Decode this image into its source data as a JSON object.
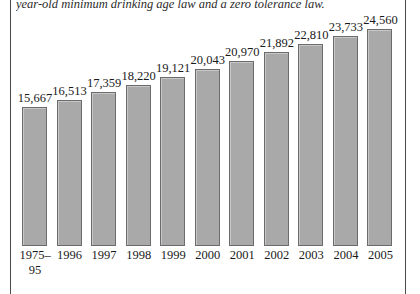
{
  "caption": {
    "text": "year-old minimum drinking age law and a zero tolerance law."
  },
  "chart_data": {
    "type": "bar",
    "title": "",
    "subtitle": "",
    "xlabel": "",
    "ylabel": "",
    "grid": false,
    "legend": null,
    "axis_line": false,
    "ylim": [
      0,
      26000
    ],
    "categories": [
      "1975–95",
      "1996",
      "1997",
      "1998",
      "1999",
      "2000",
      "2001",
      "2002",
      "2003",
      "2004",
      "2005"
    ],
    "category_lines": [
      [
        "1975–",
        "95"
      ],
      [
        "1996"
      ],
      [
        "1997"
      ],
      [
        "1998"
      ],
      [
        "1999"
      ],
      [
        "2000"
      ],
      [
        "2001"
      ],
      [
        "2002"
      ],
      [
        "2003"
      ],
      [
        "2004"
      ],
      [
        "2005"
      ]
    ],
    "values": [
      15667,
      16513,
      17359,
      18220,
      19121,
      20043,
      20970,
      21892,
      22810,
      23733,
      24560
    ],
    "value_labels": [
      "15,667",
      "16,513",
      "17,359",
      "18,220",
      "19,121",
      "20,043",
      "20,970",
      "21,892",
      "22,810",
      "23,733",
      "24,560"
    ],
    "colors": {
      "bar_fill": "#a9a9a9",
      "bar_border": "#6b6b6b",
      "text": "#1a1a1a",
      "frame_rule": "#4a4a4a",
      "background": "#ffffff"
    }
  }
}
